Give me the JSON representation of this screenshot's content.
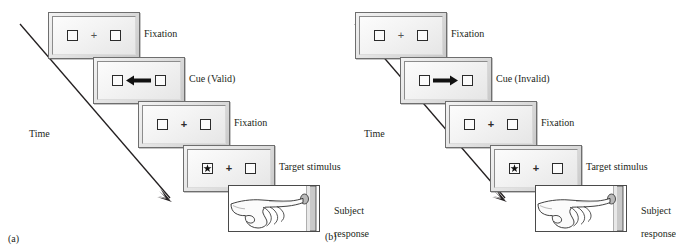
{
  "figure": {
    "type": "diagram",
    "time_axis_label": "Time"
  },
  "panels": [
    {
      "caption": "(a)",
      "condition": "valid",
      "time_label": "Time",
      "steps": [
        {
          "label": "Fixation",
          "screen": {
            "left_box": "empty",
            "center": "+",
            "right_box": "empty"
          }
        },
        {
          "label": "Cue (Valid)",
          "screen": {
            "left_box": "empty",
            "center": "arrow-left",
            "right_box": "empty"
          }
        },
        {
          "label": "Fixation",
          "screen": {
            "left_box": "empty",
            "center": "+",
            "right_box": "empty"
          }
        },
        {
          "label": "Target stimulus",
          "screen": {
            "left_box": "star",
            "center": "+",
            "right_box": "empty"
          }
        },
        {
          "label": "Subject\nresponse",
          "screen": {
            "image": "hand-pressing-button"
          }
        }
      ]
    },
    {
      "caption": "(b)",
      "condition": "invalid",
      "time_label": "Time",
      "steps": [
        {
          "label": "Fixation",
          "screen": {
            "left_box": "empty",
            "center": "+",
            "right_box": "empty"
          }
        },
        {
          "label": "Cue (Invalid)",
          "screen": {
            "left_box": "empty",
            "center": "arrow-right",
            "right_box": "empty"
          }
        },
        {
          "label": "Fixation",
          "screen": {
            "left_box": "empty",
            "center": "+",
            "right_box": "empty"
          }
        },
        {
          "label": "Target stimulus",
          "screen": {
            "left_box": "star",
            "center": "+",
            "right_box": "empty"
          }
        },
        {
          "label": "Subject\nresponse",
          "screen": {
            "image": "hand-pressing-button"
          }
        }
      ]
    }
  ],
  "colors": {
    "ink": "#231f20",
    "screen_border": "#6e6e6e",
    "screen_fill": "#e8e8e8",
    "box_stroke": "#2b2b2b",
    "background": "#ffffff"
  }
}
